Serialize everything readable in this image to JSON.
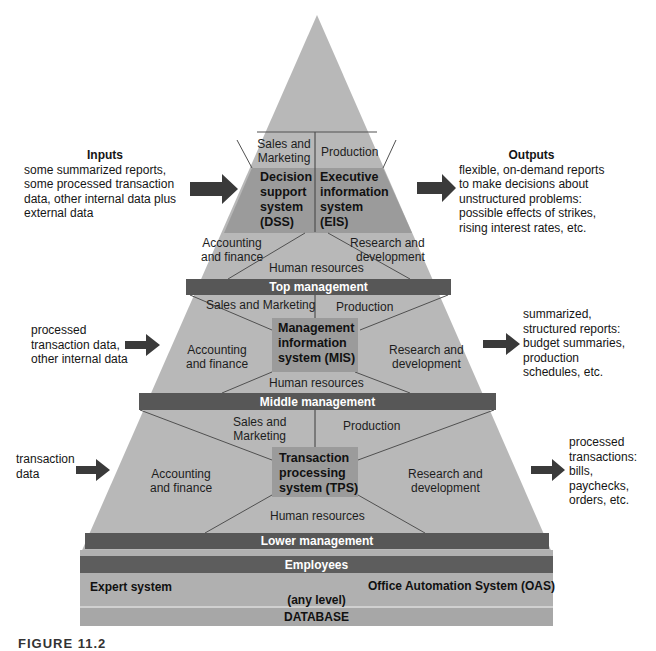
{
  "colors": {
    "pyramid_fill": "#b7b7b7",
    "system_box_fill": "#9a9a9a",
    "band_fill": "#555555",
    "band_text": "#ffffff",
    "arrow": "#3a3a3a",
    "line": "#4a4a4a"
  },
  "top_level": {
    "functions": {
      "sales": "Sales and\nMarketing",
      "production": "Production",
      "accounting": "Accounting\nand finance",
      "research": "Research and\ndevelopment",
      "hr": "Human resources"
    },
    "systems": [
      {
        "label": "Decision support system (DSS)",
        "lines": [
          "Decision",
          "support",
          "system",
          "(DSS)"
        ]
      },
      {
        "label": "Executive information system (EIS)",
        "lines": [
          "Executive",
          "information",
          "system",
          "(EIS)"
        ]
      }
    ],
    "band": "Top management",
    "inputs": {
      "title": "Inputs",
      "lines": [
        "some summarized reports,",
        "some processed transaction",
        "data, other internal data plus",
        "external data"
      ]
    },
    "outputs": {
      "title": "Outputs",
      "lines": [
        "flexible, on-demand reports",
        "to make decisions about",
        "unstructured problems:",
        "possible effects of strikes,",
        "rising interest rates, etc."
      ]
    }
  },
  "middle_level": {
    "functions": {
      "sales": "Sales and Marketing",
      "production": "Production",
      "accounting": [
        "Accounting",
        "and finance"
      ],
      "research": [
        "Research and",
        "development"
      ],
      "hr": "Human resources"
    },
    "system": {
      "label": "Management information system (MIS)",
      "lines": [
        "Management",
        "information",
        "system (MIS)"
      ]
    },
    "band": "Middle management",
    "inputs": {
      "lines": [
        "processed",
        "transaction data,",
        "other internal data"
      ]
    },
    "outputs": {
      "lines": [
        "summarized,",
        "structured reports:",
        "budget summaries,",
        "production",
        "schedules, etc."
      ]
    }
  },
  "lower_level": {
    "functions": {
      "sales": [
        "Sales and",
        "Marketing"
      ],
      "production": "Production",
      "accounting": [
        "Accounting",
        "and finance"
      ],
      "research": [
        "Research and",
        "development"
      ],
      "hr": "Human resources"
    },
    "system": {
      "label": "Transaction processing system (TPS)",
      "lines": [
        "Transaction",
        "processing",
        "system (TPS)"
      ]
    },
    "band": "Lower management",
    "inputs": {
      "lines": [
        "transaction",
        "data"
      ]
    },
    "outputs": {
      "lines": [
        "processed",
        "transactions:",
        "bills,",
        "paychecks,",
        "orders, etc."
      ]
    }
  },
  "base": {
    "employees_band": "Employees",
    "expert_system": "Expert system",
    "oas": "Office Automation System (OAS)",
    "any_level": "(any level)",
    "database": "DATABASE"
  },
  "caption": "FIGURE 11.2"
}
